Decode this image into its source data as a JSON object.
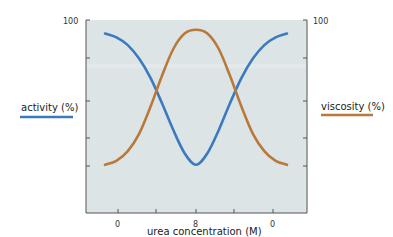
{
  "chart_data": {
    "type": "line",
    "title": "",
    "xlabel": "urea concentration (M)",
    "ylabel_left": "activity (%)",
    "ylabel_right": "viscosity (%)",
    "x_tick_labels": [
      "0",
      "",
      "8",
      "",
      "0"
    ],
    "y_tick_labels_left": [
      "100",
      "",
      "",
      "",
      ""
    ],
    "y_tick_labels_right": [
      "100",
      "",
      "",
      "",
      ""
    ],
    "ylim": [
      0,
      100
    ],
    "x": [
      0,
      1,
      2,
      3,
      4,
      5,
      6,
      7,
      8,
      9,
      10,
      11,
      12,
      13,
      14,
      15,
      16
    ],
    "x_note": "x runs from 0 M urea up to 8 M and back down to 0 M (denaturation then renaturation)",
    "series": [
      {
        "name": "activity (%)",
        "color": "#3a7bbf",
        "values": [
          93,
          91,
          87,
          80,
          70,
          57,
          43,
          31,
          25,
          31,
          43,
          57,
          70,
          80,
          87,
          91,
          93
        ]
      },
      {
        "name": "viscosity (%)",
        "color": "#b8793a",
        "values": [
          25,
          27,
          32,
          41,
          55,
          71,
          85,
          93,
          95,
          93,
          85,
          71,
          55,
          41,
          32,
          27,
          25
        ]
      }
    ],
    "grid": false,
    "legend_position": "sides",
    "background": "#dde4e6"
  },
  "labels": {
    "left_axis_top": "100",
    "right_axis_top": "100",
    "x_tick_0": "0",
    "x_tick_8": "8",
    "x_tick_0_end": "0",
    "xlabel": "urea concentration (M)",
    "activity_legend": "activity (%)",
    "viscosity_legend": "viscosity (%)"
  },
  "colors": {
    "activity": "#3a7bbf",
    "viscosity": "#b8793a",
    "plot_bg": "#dde4e6",
    "axis": "#555555"
  }
}
